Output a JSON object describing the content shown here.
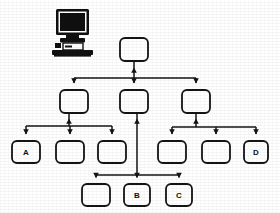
{
  "canvas": {
    "width": 280,
    "height": 213,
    "background": "#ffffff"
  },
  "style": {
    "stroke": "#141414",
    "node_fill": "#ffffff",
    "node_stroke_width": 1.8,
    "link_stroke_width": 1.5,
    "corner_radius": 5,
    "label_color": "#111111",
    "icon_color": "#101010"
  },
  "diagram": {
    "type": "hierarchy",
    "icon": {
      "name": "computer-workstation-icon",
      "x": 52,
      "y": 8,
      "width": 42,
      "height": 48
    },
    "nodes": [
      {
        "id": "root",
        "label": "",
        "x": 120,
        "y": 38,
        "w": 28,
        "h": 23,
        "row": 1
      },
      {
        "id": "m1",
        "label": "",
        "x": 60,
        "y": 90,
        "w": 28,
        "h": 23,
        "row": 2
      },
      {
        "id": "m2",
        "label": "",
        "x": 120,
        "y": 90,
        "w": 28,
        "h": 23,
        "row": 2
      },
      {
        "id": "m3",
        "label": "",
        "x": 182,
        "y": 90,
        "w": 28,
        "h": 23,
        "row": 2
      },
      {
        "id": "a",
        "label": "A",
        "x": 12,
        "y": 141,
        "w": 28,
        "h": 22,
        "row": 3
      },
      {
        "id": "l2",
        "label": "",
        "x": 56,
        "y": 141,
        "w": 28,
        "h": 22,
        "row": 3
      },
      {
        "id": "l3",
        "label": "",
        "x": 98,
        "y": 141,
        "w": 28,
        "h": 22,
        "row": 3
      },
      {
        "id": "r1",
        "label": "",
        "x": 158,
        "y": 141,
        "w": 28,
        "h": 22,
        "row": 3
      },
      {
        "id": "r2",
        "label": "",
        "x": 202,
        "y": 141,
        "w": 28,
        "h": 22,
        "row": 3
      },
      {
        "id": "d",
        "label": "D",
        "x": 244,
        "y": 141,
        "w": 24,
        "h": 22,
        "row": 3
      },
      {
        "id": "b0",
        "label": "",
        "x": 82,
        "y": 184,
        "w": 28,
        "h": 22,
        "row": 4
      },
      {
        "id": "b",
        "label": "B",
        "x": 124,
        "y": 184,
        "w": 26,
        "h": 22,
        "row": 4
      },
      {
        "id": "c",
        "label": "C",
        "x": 166,
        "y": 184,
        "w": 26,
        "h": 22,
        "row": 4
      }
    ],
    "buses": [
      {
        "name": "row2-bus",
        "y": 78,
        "x1": 74,
        "x2": 196
      },
      {
        "name": "left-sub-bus",
        "y": 126,
        "x1": 26,
        "x2": 112
      },
      {
        "name": "right-sub-bus",
        "y": 127,
        "x1": 172,
        "x2": 256
      },
      {
        "name": "bottom-bus",
        "y": 175,
        "x1": 96,
        "x2": 179
      }
    ],
    "links": [
      {
        "name": "root-uplink",
        "from": "row2-bus",
        "to": "root",
        "direction": "up"
      },
      {
        "name": "bus-to-m1",
        "from": "row2-bus",
        "to": "m1",
        "direction": "down"
      },
      {
        "name": "bus-to-m2",
        "from": "row2-bus",
        "to": "m2",
        "direction": "down"
      },
      {
        "name": "bus-to-m3",
        "from": "row2-bus",
        "to": "m3",
        "direction": "down"
      },
      {
        "name": "left-bus-to-m1",
        "from": "left-sub-bus",
        "to": "m1",
        "direction": "up"
      },
      {
        "name": "left-bus-to-a",
        "from": "left-sub-bus",
        "to": "a",
        "direction": "down"
      },
      {
        "name": "left-bus-to-l2",
        "from": "left-sub-bus",
        "to": "l2",
        "direction": "down"
      },
      {
        "name": "left-bus-to-l3",
        "from": "left-sub-bus",
        "to": "l3",
        "direction": "down"
      },
      {
        "name": "right-bus-to-m3",
        "from": "right-sub-bus",
        "to": "m3",
        "direction": "up"
      },
      {
        "name": "right-bus-to-r1",
        "from": "right-sub-bus",
        "to": "r1",
        "direction": "down"
      },
      {
        "name": "right-bus-to-r2",
        "from": "right-sub-bus",
        "to": "r2",
        "direction": "down"
      },
      {
        "name": "right-bus-to-d",
        "from": "right-sub-bus",
        "to": "d",
        "direction": "down"
      },
      {
        "name": "bottom-bus-to-m2",
        "from": "bottom-bus",
        "to": "m2",
        "direction": "up"
      },
      {
        "name": "bottom-bus-to-b0",
        "from": "bottom-bus",
        "to": "b0",
        "direction": "down"
      },
      {
        "name": "bottom-bus-to-b",
        "from": "bottom-bus",
        "to": "b",
        "direction": "down"
      },
      {
        "name": "bottom-bus-to-c",
        "from": "bottom-bus",
        "to": "c",
        "direction": "down"
      }
    ]
  }
}
